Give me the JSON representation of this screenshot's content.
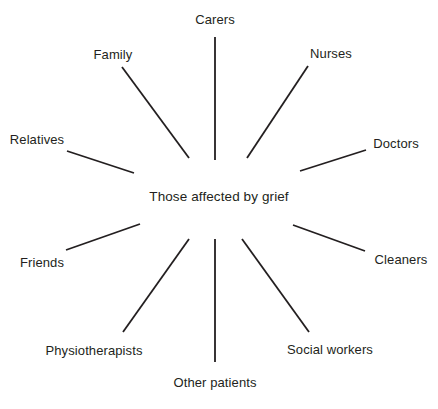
{
  "diagram": {
    "type": "radial-spoke",
    "center": {
      "label": "Those affected by grief",
      "x": 219,
      "y": 197
    },
    "canvas": {
      "width": 438,
      "height": 409,
      "background": "#ffffff"
    },
    "line_color": "#231f20",
    "line_width": 1.8,
    "nodes": [
      {
        "id": "carers",
        "label": "Carers",
        "label_x": 215,
        "label_y": 19,
        "line": {
          "x1": 215,
          "y1": 37,
          "x2": 215,
          "y2": 160
        }
      },
      {
        "id": "nurses",
        "label": "Nurses",
        "label_x": 331,
        "label_y": 53,
        "line": {
          "x1": 308,
          "y1": 66,
          "x2": 247,
          "y2": 158
        }
      },
      {
        "id": "doctors",
        "label": "Doctors",
        "label_x": 396,
        "label_y": 143,
        "line": {
          "x1": 366,
          "y1": 150,
          "x2": 300,
          "y2": 171
        }
      },
      {
        "id": "cleaners",
        "label": "Cleaners",
        "label_x": 401,
        "label_y": 259,
        "line": {
          "x1": 365,
          "y1": 251,
          "x2": 293,
          "y2": 225
        }
      },
      {
        "id": "social-workers",
        "label": "Social workers",
        "label_x": 330,
        "label_y": 349,
        "line": {
          "x1": 309,
          "y1": 332,
          "x2": 242,
          "y2": 239
        }
      },
      {
        "id": "other-patients",
        "label": "Other patients",
        "label_x": 215,
        "label_y": 382,
        "line": {
          "x1": 215,
          "y1": 362,
          "x2": 215,
          "y2": 239
        }
      },
      {
        "id": "physiotherapists",
        "label": "Physiotherapists",
        "label_x": 94,
        "label_y": 350,
        "line": {
          "x1": 123,
          "y1": 332,
          "x2": 189,
          "y2": 239
        }
      },
      {
        "id": "friends",
        "label": "Friends",
        "label_x": 42,
        "label_y": 262,
        "line": {
          "x1": 66,
          "y1": 250,
          "x2": 140,
          "y2": 224
        }
      },
      {
        "id": "relatives",
        "label": "Relatives",
        "label_x": 37,
        "label_y": 139,
        "line": {
          "x1": 67,
          "y1": 151,
          "x2": 134,
          "y2": 173
        }
      },
      {
        "id": "family",
        "label": "Family",
        "label_x": 113,
        "label_y": 54,
        "line": {
          "x1": 122,
          "y1": 67,
          "x2": 189,
          "y2": 158
        }
      }
    ]
  }
}
